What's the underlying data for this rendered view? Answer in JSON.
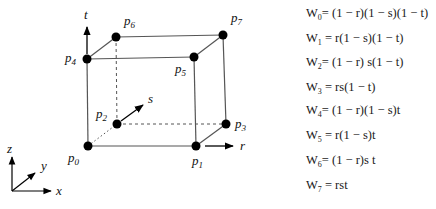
{
  "diagram": {
    "vertices": [
      {
        "id": "p0",
        "label": "p",
        "sub": "0",
        "x": 88,
        "y": 146
      },
      {
        "id": "p1",
        "label": "p",
        "sub": "1",
        "x": 196,
        "y": 146
      },
      {
        "id": "p2",
        "label": "p",
        "sub": "2",
        "x": 117,
        "y": 124
      },
      {
        "id": "p3",
        "label": "p",
        "sub": "3",
        "x": 226,
        "y": 124
      },
      {
        "id": "p4",
        "label": "p",
        "sub": "4",
        "x": 87,
        "y": 59
      },
      {
        "id": "p5",
        "label": "p",
        "sub": "5",
        "x": 194,
        "y": 57
      },
      {
        "id": "p6",
        "label": "p",
        "sub": "6",
        "x": 116,
        "y": 37
      },
      {
        "id": "p7",
        "label": "p",
        "sub": "7",
        "x": 223,
        "y": 35
      }
    ],
    "parametric_axes": {
      "r": "r",
      "s": "s",
      "t": "t"
    },
    "world_axes": {
      "x": "x",
      "y": "y",
      "z": "z"
    },
    "colors": {
      "line": "#555555",
      "point": "#000000"
    }
  },
  "equations": [
    {
      "w": "W",
      "sub": "0",
      "rhs": "= (1 − r)(1 − s)(1 − t)"
    },
    {
      "w": "W",
      "sub": "1",
      "rhs": " =  r(1 − s)(1 − t)"
    },
    {
      "w": "W",
      "sub": "2",
      "rhs": "= (1 − r)  s(1 − t)"
    },
    {
      "w": "W",
      "sub": "3",
      "rhs": " =  rs(1 − t)"
    },
    {
      "w": "W",
      "sub": "4",
      "rhs": "= (1 − r)(1 − s)t"
    },
    {
      "w": "W",
      "sub": "5",
      "rhs": " =  r(1 − s)t"
    },
    {
      "w": "W",
      "sub": "6",
      "rhs": "= (1 − r)s  t"
    },
    {
      "w": "W",
      "sub": "7",
      "rhs": " =  rst"
    }
  ]
}
